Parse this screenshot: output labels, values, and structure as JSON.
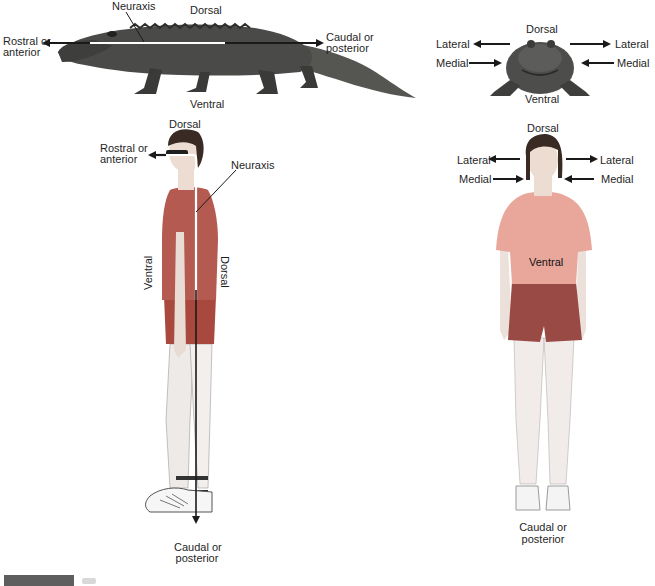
{
  "figure": {
    "type": "anatomical-orientation-diagram",
    "panels": [
      {
        "id": "alligator-side",
        "subject": "alligator (side view)",
        "labels": {
          "neuraxis": "Neuraxis",
          "dorsal": "Dorsal",
          "ventral": "Ventral",
          "rostral_line1": "Rostral or",
          "rostral_line2": "anterior",
          "caudal_line1": "Caudal or",
          "caudal_line2": "posterior"
        }
      },
      {
        "id": "alligator-front",
        "subject": "alligator (front view)",
        "labels": {
          "dorsal": "Dorsal",
          "ventral": "Ventral",
          "lateral_left": "Lateral",
          "lateral_right": "Lateral",
          "medial_left": "Medial",
          "medial_right": "Medial"
        }
      },
      {
        "id": "human-side",
        "subject": "man (side view)",
        "labels": {
          "dorsal_top": "Dorsal",
          "rostral_line1": "Rostral or",
          "rostral_line2": "anterior",
          "neuraxis": "Neuraxis",
          "ventral_vertical": "Ventral",
          "dorsal_vertical": "Dorsal",
          "caudal_line1": "Caudal or",
          "caudal_line2": "posterior"
        }
      },
      {
        "id": "human-front",
        "subject": "woman (front view)",
        "labels": {
          "dorsal": "Dorsal",
          "lateral_left": "Lateral",
          "lateral_right": "Lateral",
          "medial_left": "Medial",
          "medial_right": "Medial",
          "ventral": "Ventral",
          "caudal_line1": "Caudal or",
          "caudal_line2": "posterior"
        }
      }
    ]
  },
  "colors": {
    "arrow": "#1a1a1a",
    "neuraxis_line": "#ffffff",
    "alligator": "#4a4a48",
    "man_shirt": "#b45a50",
    "man_shorts": "#a8483f",
    "woman_shirt": "#e9a79c",
    "woman_shorts": "#9a4a45",
    "skin": "#f2e6df",
    "hair": "#3a2a24"
  }
}
